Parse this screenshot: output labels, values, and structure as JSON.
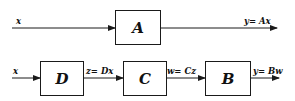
{
  "diagram": {
    "type": "block-diagram",
    "top_row": {
      "input_label": "x",
      "block": "A",
      "output_label": "y= Ax"
    },
    "bottom_row": {
      "input_label": "x",
      "blocks": [
        "D",
        "C",
        "B"
      ],
      "edge_labels": [
        "z= Dx",
        "w= Cz",
        "y= Bw"
      ]
    },
    "colors": {
      "stroke": "#1a1a1a",
      "background": "#ffffff"
    }
  }
}
